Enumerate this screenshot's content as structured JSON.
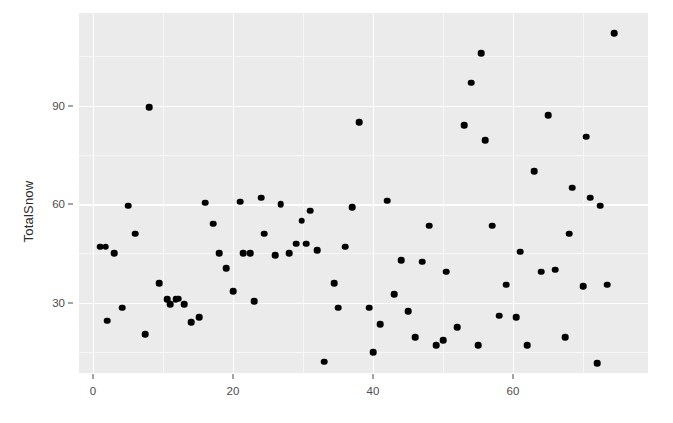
{
  "chart_data": {
    "type": "scatter",
    "title": "",
    "xlabel": "",
    "ylabel": "TotalSnow",
    "xlim": [
      -2.0,
      79.3
    ],
    "ylim": [
      8.6,
      118.2
    ],
    "xticks": [
      0,
      20,
      40,
      60
    ],
    "xtick_labels": [
      "0",
      "20",
      "40",
      "60"
    ],
    "yticks": [
      30,
      60,
      90
    ],
    "ytick_labels": [
      "30",
      "60",
      "90"
    ],
    "x_minor_ticks": [
      10,
      30,
      50,
      70
    ],
    "y_minor_ticks": [
      15,
      45,
      75,
      105
    ],
    "grid": true,
    "legend": null,
    "point_color": "#000000",
    "panel_background": "#ebebeb",
    "grid_color": "#ffffff",
    "n_points": 81,
    "points": [
      {
        "x": 1.0,
        "y": 47.0
      },
      {
        "x": 2.0,
        "y": 24.5
      },
      {
        "x": 3.0,
        "y": 45.0
      },
      {
        "x": 4.2,
        "y": 28.5
      },
      {
        "x": 5.0,
        "y": 59.5
      },
      {
        "x": 6.0,
        "y": 51.0
      },
      {
        "x": 7.5,
        "y": 20.5
      },
      {
        "x": 8.0,
        "y": 89.5
      },
      {
        "x": 9.5,
        "y": 36.0
      },
      {
        "x": 10.6,
        "y": 31.0
      },
      {
        "x": 11.0,
        "y": 29.5
      },
      {
        "x": 12.2,
        "y": 31.2
      },
      {
        "x": 13.0,
        "y": 29.5
      },
      {
        "x": 14.0,
        "y": 24.0
      },
      {
        "x": 15.2,
        "y": 25.5
      },
      {
        "x": 16.0,
        "y": 60.5
      },
      {
        "x": 17.2,
        "y": 54.0
      },
      {
        "x": 18.0,
        "y": 45.0
      },
      {
        "x": 19.0,
        "y": 40.5
      },
      {
        "x": 20.0,
        "y": 33.5
      },
      {
        "x": 21.0,
        "y": 60.8
      },
      {
        "x": 21.5,
        "y": 45.0
      },
      {
        "x": 23.0,
        "y": 30.5
      },
      {
        "x": 24.0,
        "y": 62.0
      },
      {
        "x": 24.5,
        "y": 51.0
      },
      {
        "x": 26.0,
        "y": 44.5
      },
      {
        "x": 26.8,
        "y": 60.0
      },
      {
        "x": 28.0,
        "y": 45.0
      },
      {
        "x": 29.8,
        "y": 55.0
      },
      {
        "x": 30.5,
        "y": 48.0
      },
      {
        "x": 31.0,
        "y": 58.0
      },
      {
        "x": 32.0,
        "y": 46.0
      },
      {
        "x": 33.0,
        "y": 12.0
      },
      {
        "x": 34.5,
        "y": 36.0
      },
      {
        "x": 35.0,
        "y": 28.5
      },
      {
        "x": 36.0,
        "y": 47.0
      },
      {
        "x": 37.0,
        "y": 59.0
      },
      {
        "x": 38.0,
        "y": 85.0
      },
      {
        "x": 39.5,
        "y": 28.5
      },
      {
        "x": 40.0,
        "y": 15.0
      },
      {
        "x": 41.0,
        "y": 23.5
      },
      {
        "x": 42.0,
        "y": 61.0
      },
      {
        "x": 43.0,
        "y": 32.5
      },
      {
        "x": 44.0,
        "y": 43.0
      },
      {
        "x": 45.0,
        "y": 27.5
      },
      {
        "x": 46.0,
        "y": 19.5
      },
      {
        "x": 47.0,
        "y": 42.5
      },
      {
        "x": 48.0,
        "y": 53.5
      },
      {
        "x": 49.0,
        "y": 17.0
      },
      {
        "x": 50.0,
        "y": 18.5
      },
      {
        "x": 50.5,
        "y": 39.5
      },
      {
        "x": 52.0,
        "y": 22.5
      },
      {
        "x": 53.0,
        "y": 84.0
      },
      {
        "x": 54.0,
        "y": 97.0
      },
      {
        "x": 55.0,
        "y": 17.0
      },
      {
        "x": 55.5,
        "y": 106.0
      },
      {
        "x": 56.0,
        "y": 79.5
      },
      {
        "x": 57.0,
        "y": 53.5
      },
      {
        "x": 58.0,
        "y": 26.0
      },
      {
        "x": 59.0,
        "y": 35.5
      },
      {
        "x": 60.5,
        "y": 25.5
      },
      {
        "x": 61.0,
        "y": 45.5
      },
      {
        "x": 62.0,
        "y": 17.0
      },
      {
        "x": 63.0,
        "y": 70.0
      },
      {
        "x": 64.0,
        "y": 39.5
      },
      {
        "x": 65.0,
        "y": 87.0
      },
      {
        "x": 66.0,
        "y": 40.0
      },
      {
        "x": 67.5,
        "y": 19.5
      },
      {
        "x": 68.0,
        "y": 51.0
      },
      {
        "x": 68.5,
        "y": 65.0
      },
      {
        "x": 70.0,
        "y": 35.0
      },
      {
        "x": 70.5,
        "y": 80.5
      },
      {
        "x": 71.0,
        "y": 62.0
      },
      {
        "x": 72.0,
        "y": 11.5
      },
      {
        "x": 72.5,
        "y": 59.5
      },
      {
        "x": 73.5,
        "y": 35.5
      },
      {
        "x": 74.5,
        "y": 112.0
      },
      {
        "x": 1.8,
        "y": 47.0
      },
      {
        "x": 29.0,
        "y": 48.0
      },
      {
        "x": 22.5,
        "y": 45.0
      },
      {
        "x": 11.8,
        "y": 31.0
      }
    ]
  }
}
